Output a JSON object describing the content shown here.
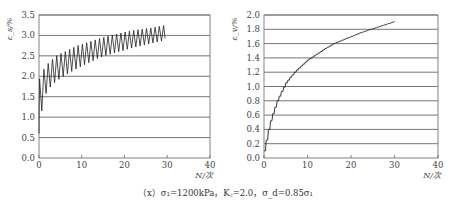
{
  "caption": "（x）σ₁=1200kPa，K꜀=2.0，σ_d=0.85σ₁",
  "chart_data": [
    {
      "type": "line",
      "title": "",
      "xlabel": "N/次",
      "ylabel": "ε_s/%",
      "xlim": [
        0,
        40
      ],
      "ylim": [
        0,
        3.5
      ],
      "xticks": [
        "0",
        "10",
        "20",
        "30",
        "40"
      ],
      "yticks": [
        "0.0",
        "0.5",
        "1.0",
        "1.5",
        "2.0",
        "2.5",
        "3.0",
        "3.5"
      ],
      "grid": "horizontal",
      "legend": null,
      "description": "Cyclic oscillating strain; upper envelope and lower envelope per cycle",
      "series": [
        {
          "name": "upper envelope",
          "x": [
            0,
            1,
            2,
            3,
            4,
            5,
            6,
            7,
            8,
            9,
            10,
            12,
            14,
            16,
            18,
            20,
            22,
            24,
            26,
            28,
            29.5
          ],
          "values": [
            1.9,
            2.15,
            2.3,
            2.4,
            2.5,
            2.55,
            2.6,
            2.65,
            2.7,
            2.75,
            2.78,
            2.85,
            2.92,
            2.98,
            3.03,
            3.08,
            3.12,
            3.15,
            3.18,
            3.22,
            3.25
          ]
        },
        {
          "name": "lower envelope",
          "x": [
            0,
            1,
            2,
            3,
            4,
            5,
            6,
            7,
            8,
            9,
            10,
            12,
            14,
            16,
            18,
            20,
            22,
            24,
            26,
            28,
            29.5
          ],
          "values": [
            0.6,
            1.45,
            1.65,
            1.78,
            1.88,
            1.95,
            2.02,
            2.08,
            2.14,
            2.2,
            2.25,
            2.35,
            2.45,
            2.52,
            2.58,
            2.64,
            2.7,
            2.75,
            2.8,
            2.85,
            2.88
          ]
        }
      ]
    },
    {
      "type": "line",
      "title": "",
      "xlabel": "N/次",
      "ylabel": "ε_v/%",
      "xlim": [
        0,
        40
      ],
      "ylim": [
        0,
        2.0
      ],
      "xticks": [
        "0",
        "10",
        "20",
        "30",
        "40"
      ],
      "yticks": [
        "0.0",
        "0.2",
        "0.4",
        "0.6",
        "0.8",
        "1.0",
        "1.2",
        "1.4",
        "1.6",
        "1.8",
        "2.0"
      ],
      "grid": "horizontal",
      "legend": null,
      "series": [
        {
          "name": "volumetric strain",
          "x": [
            0,
            0.5,
            1,
            1.5,
            2,
            3,
            4,
            5,
            6,
            7,
            8,
            10,
            12,
            14,
            16,
            18,
            20,
            22,
            24,
            26,
            28,
            30
          ],
          "values": [
            0.1,
            0.25,
            0.4,
            0.52,
            0.62,
            0.8,
            0.93,
            1.05,
            1.13,
            1.2,
            1.26,
            1.37,
            1.45,
            1.53,
            1.6,
            1.65,
            1.7,
            1.75,
            1.79,
            1.83,
            1.87,
            1.91
          ]
        }
      ]
    }
  ]
}
